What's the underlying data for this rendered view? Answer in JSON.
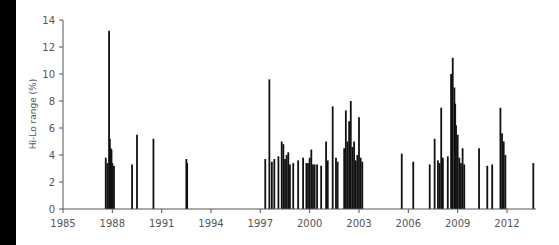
{
  "chart_data": {
    "type": "bar",
    "title": "",
    "xlabel": "",
    "ylabel": "Hi-Lo range (%)",
    "ylim": [
      0,
      14
    ],
    "xlim": [
      1985,
      2013.8
    ],
    "yticks": [
      0,
      2,
      4,
      6,
      8,
      10,
      12,
      14
    ],
    "xticks": [
      "1985",
      "1988",
      "1991",
      "1994",
      "1997",
      "2000",
      "2003",
      "2006",
      "2009",
      "2012"
    ],
    "grid": false,
    "legend": null,
    "x": [
      1987.6,
      1987.7,
      1987.8,
      1987.85,
      1987.9,
      1987.95,
      1988.0,
      1988.1,
      1989.2,
      1989.5,
      1990.5,
      1992.5,
      1992.55,
      1997.3,
      1997.55,
      1997.7,
      1997.85,
      1998.1,
      1998.3,
      1998.4,
      1998.5,
      1998.6,
      1998.7,
      1998.8,
      1999.0,
      1999.3,
      1999.6,
      1999.8,
      1999.9,
      2000.0,
      2000.1,
      2000.2,
      2000.3,
      2000.45,
      2000.7,
      2001.0,
      2001.1,
      2001.4,
      2001.6,
      2001.7,
      2002.1,
      2002.2,
      2002.3,
      2002.4,
      2002.5,
      2002.6,
      2002.7,
      2002.8,
      2002.9,
      2003.0,
      2003.1,
      2003.2,
      2005.6,
      2006.3,
      2007.3,
      2007.6,
      2007.8,
      2007.9,
      2008.0,
      2008.1,
      2008.4,
      2008.6,
      2008.7,
      2008.8,
      2008.85,
      2008.9,
      2009.0,
      2009.1,
      2009.2,
      2009.3,
      2009.4,
      2010.3,
      2010.8,
      2011.1,
      2011.6,
      2011.7,
      2011.8,
      2011.9,
      2013.6
    ],
    "values": [
      3.8,
      3.4,
      13.2,
      5.2,
      4.5,
      4.4,
      3.4,
      3.2,
      3.3,
      5.5,
      5.2,
      3.7,
      3.4,
      3.7,
      9.6,
      3.5,
      3.7,
      3.9,
      5.0,
      4.8,
      3.7,
      4.0,
      4.2,
      3.3,
      3.4,
      3.6,
      3.8,
      3.4,
      3.4,
      3.8,
      4.4,
      3.3,
      3.3,
      3.3,
      3.2,
      5.0,
      3.6,
      7.6,
      3.8,
      3.5,
      4.5,
      7.3,
      5.0,
      6.5,
      8.0,
      4.6,
      5.0,
      3.6,
      4.0,
      6.8,
      3.8,
      3.5,
      4.1,
      3.5,
      3.3,
      5.2,
      3.6,
      3.4,
      7.5,
      3.8,
      3.9,
      10.0,
      11.2,
      9.0,
      7.8,
      6.2,
      5.5,
      3.8,
      3.4,
      4.5,
      3.3,
      4.5,
      3.2,
      3.3,
      7.5,
      5.6,
      5.0,
      4.0,
      3.4
    ]
  },
  "axes": {
    "ylabel": "Hi-Lo range (%)",
    "yticks": [
      "0",
      "2",
      "4",
      "6",
      "8",
      "10",
      "12",
      "14"
    ],
    "xticks": [
      "1985",
      "1988",
      "1991",
      "1994",
      "1997",
      "2000",
      "2003",
      "2006",
      "2009",
      "2012"
    ]
  },
  "colors": {
    "bar": "#111111",
    "axis": "#555555",
    "text": "#555555",
    "band": "#000000"
  }
}
